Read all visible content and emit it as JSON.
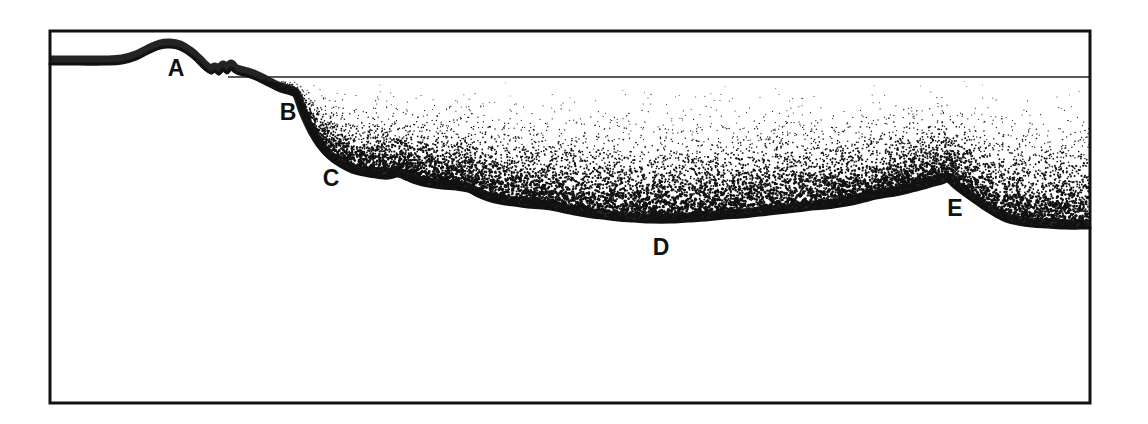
{
  "figure": {
    "background_color": "#ffffff",
    "ink_color": "#111111",
    "frame": {
      "name": "outer-frame",
      "x": 50,
      "y": 31,
      "width": 1040,
      "height": 372,
      "stroke_width": 3
    },
    "sea_level_line": {
      "name": "sea-level-line",
      "y": 77,
      "x_start": 228,
      "x_end": 1090,
      "stroke_width": 1.6
    },
    "labels": [
      {
        "id": "A",
        "text": "A",
        "x": 176,
        "y": 76,
        "meaning": "coastal-plain-summit"
      },
      {
        "id": "B",
        "text": "B",
        "x": 288,
        "y": 120,
        "meaning": "shelf-break"
      },
      {
        "id": "C",
        "text": "C",
        "x": 331,
        "y": 186,
        "meaning": "continental-slope"
      },
      {
        "id": "D",
        "text": "D",
        "x": 661,
        "y": 255,
        "meaning": "abyssal-plain"
      },
      {
        "id": "E",
        "text": "E",
        "x": 955,
        "y": 216,
        "meaning": "seamount"
      }
    ],
    "profile": {
      "name": "land-and-seafloor-profile",
      "stroke_width": 3.2,
      "points": [
        [
          50,
          64
        ],
        [
          78,
          64
        ],
        [
          104,
          64
        ],
        [
          122,
          63
        ],
        [
          136,
          59
        ],
        [
          148,
          53
        ],
        [
          160,
          48
        ],
        [
          170,
          47
        ],
        [
          180,
          49
        ],
        [
          190,
          55
        ],
        [
          198,
          62
        ],
        [
          205,
          69
        ],
        [
          211,
          73
        ],
        [
          215,
          71
        ],
        [
          219,
          74
        ],
        [
          223,
          69
        ],
        [
          227,
          73
        ],
        [
          231,
          68
        ],
        [
          235,
          72
        ],
        [
          240,
          74
        ],
        [
          248,
          76
        ],
        [
          256,
          79
        ],
        [
          266,
          84
        ],
        [
          276,
          89
        ],
        [
          284,
          92
        ],
        [
          291,
          94
        ],
        [
          296,
          97
        ],
        [
          299,
          104
        ],
        [
          302,
          113
        ],
        [
          307,
          125
        ],
        [
          313,
          137
        ],
        [
          320,
          148
        ],
        [
          329,
          158
        ],
        [
          340,
          166
        ],
        [
          352,
          172
        ],
        [
          364,
          175
        ],
        [
          376,
          177
        ],
        [
          388,
          178
        ],
        [
          398,
          176
        ],
        [
          406,
          179
        ],
        [
          416,
          183
        ],
        [
          428,
          186
        ],
        [
          442,
          188
        ],
        [
          456,
          189
        ],
        [
          468,
          191
        ],
        [
          478,
          196
        ],
        [
          488,
          200
        ],
        [
          500,
          203
        ],
        [
          514,
          205
        ],
        [
          528,
          207
        ],
        [
          542,
          208
        ],
        [
          556,
          210
        ],
        [
          570,
          213
        ],
        [
          586,
          216
        ],
        [
          602,
          218
        ],
        [
          618,
          220
        ],
        [
          634,
          221
        ],
        [
          652,
          222
        ],
        [
          670,
          222
        ],
        [
          688,
          221
        ],
        [
          706,
          220
        ],
        [
          724,
          218
        ],
        [
          742,
          217
        ],
        [
          760,
          215
        ],
        [
          778,
          213
        ],
        [
          796,
          211
        ],
        [
          812,
          209
        ],
        [
          826,
          208
        ],
        [
          840,
          206
        ],
        [
          852,
          204
        ],
        [
          864,
          201
        ],
        [
          876,
          198
        ],
        [
          888,
          196
        ],
        [
          900,
          194
        ],
        [
          912,
          191
        ],
        [
          924,
          188
        ],
        [
          934,
          185
        ],
        [
          942,
          183
        ],
        [
          948,
          181
        ],
        [
          952,
          185
        ],
        [
          958,
          190
        ],
        [
          966,
          196
        ],
        [
          976,
          203
        ],
        [
          986,
          210
        ],
        [
          996,
          216
        ],
        [
          1006,
          221
        ],
        [
          1018,
          224
        ],
        [
          1032,
          226
        ],
        [
          1048,
          227
        ],
        [
          1066,
          228
        ],
        [
          1080,
          228
        ],
        [
          1090,
          228
        ]
      ]
    },
    "water_stipple": {
      "name": "ocean-water-stipple",
      "description": "Stippled ocean water between sea-level line and seafloor, density increases with depth",
      "dot_color": "#111111",
      "top_y": 78,
      "seed": 20240517,
      "dot_count": 26000,
      "min_radius": 0.45,
      "max_radius": 1.35
    }
  }
}
